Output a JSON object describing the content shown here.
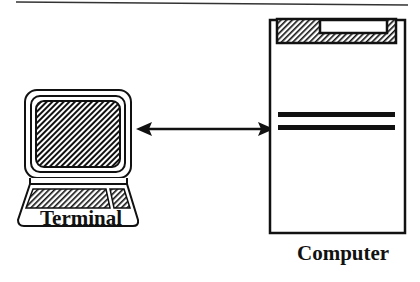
{
  "diagram": {
    "title": "",
    "nodes": [
      {
        "id": "terminal",
        "label": "Terminal",
        "icon": "terminal-icon"
      },
      {
        "id": "computer",
        "label": "Computer",
        "icon": "computer-cabinet-icon"
      }
    ],
    "edges": [
      {
        "from": "terminal",
        "to": "computer",
        "type": "bidirectional-arrow"
      }
    ],
    "colors": {
      "ink": "#111111",
      "background": "#ffffff"
    }
  }
}
